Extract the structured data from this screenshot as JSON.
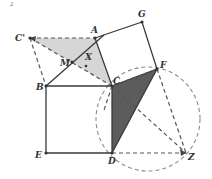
{
  "figure": {
    "corner_mark": "2",
    "points": {
      "C_prime": {
        "label": "C'",
        "x": 30,
        "y": 38
      },
      "A": {
        "label": "A",
        "x": 95,
        "y": 38
      },
      "G": {
        "label": "G",
        "x": 142,
        "y": 22
      },
      "F": {
        "label": "F",
        "x": 157,
        "y": 69
      },
      "C": {
        "label": "C",
        "x": 112,
        "y": 86
      },
      "B": {
        "label": "B",
        "x": 46,
        "y": 86
      },
      "E": {
        "label": "E",
        "x": 46,
        "y": 153
      },
      "D": {
        "label": "D",
        "x": 112,
        "y": 153
      },
      "Z": {
        "label": "Z",
        "x": 186,
        "y": 153
      },
      "M": {
        "label": "M",
        "x": 72,
        "y": 62
      },
      "X": {
        "label": "X",
        "x": 86,
        "y": 61
      }
    },
    "circle": {
      "cx": 148,
      "cy": 119,
      "r": 52,
      "style": "dashed"
    },
    "shaded_regions": [
      {
        "name": "light-triangle",
        "vertices": [
          "C'",
          "A",
          "C"
        ],
        "color": "#d4d4d4"
      },
      {
        "name": "dark-triangle",
        "vertices": [
          "C",
          "F",
          "D"
        ],
        "color": "#5a5a5a"
      }
    ],
    "squares": [
      {
        "name": "square-BCDE",
        "vertices": [
          "B",
          "C",
          "D",
          "E"
        ]
      },
      {
        "name": "square-ACFG",
        "vertices": [
          "A",
          "C",
          "F",
          "G"
        ]
      }
    ]
  }
}
